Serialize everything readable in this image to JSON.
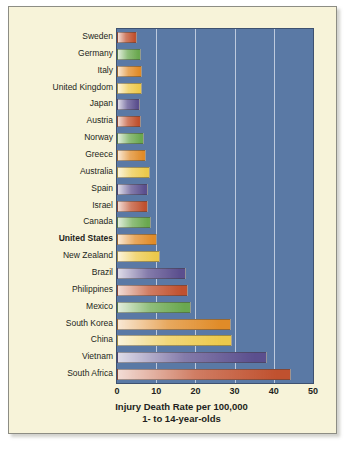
{
  "chart_data": {
    "type": "bar",
    "orientation": "horizontal",
    "title": "",
    "xlabel": "Injury Death Rate per 100,000",
    "xlabel_line2": "1- to 14-year-olds",
    "ylabel": "",
    "xlim": [
      0,
      50
    ],
    "xticks": [
      0,
      10,
      20,
      30,
      40,
      50
    ],
    "grid": true,
    "legend": "none",
    "highlight_category": "United States",
    "categories": [
      "Sweden",
      "Germany",
      "Italy",
      "United Kingdom",
      "Japan",
      "Austria",
      "Norway",
      "Greece",
      "Australia",
      "Spain",
      "Israel",
      "Canada",
      "United States",
      "New Zealand",
      "Brazil",
      "Philippines",
      "Mexico",
      "South Korea",
      "China",
      "Vietnam",
      "South Africa"
    ],
    "values": [
      5.2,
      6.0,
      6.5,
      6.3,
      5.8,
      6.1,
      7.0,
      7.5,
      8.5,
      8.0,
      8.0,
      8.7,
      10.2,
      11.0,
      17.5,
      18.0,
      19.0,
      29.0,
      29.3,
      38.3,
      44.3
    ],
    "colors": [
      "#c0512f",
      "#6aa84f",
      "#e08b28",
      "#ecc94b",
      "#5b4f8e",
      "#c0512f",
      "#6aa84f",
      "#e08b28",
      "#ecc94b",
      "#5b4f8e",
      "#c0512f",
      "#6aa84f",
      "#e08b28",
      "#ecc94b",
      "#5b4f8e",
      "#c0512f",
      "#6aa84f",
      "#e08b28",
      "#ecc94b",
      "#5b4f8e",
      "#c0512f"
    ],
    "plot_background": "#5a79a5",
    "page_background": "#f7f3d9",
    "gridline_color": "#cfd8e8"
  }
}
